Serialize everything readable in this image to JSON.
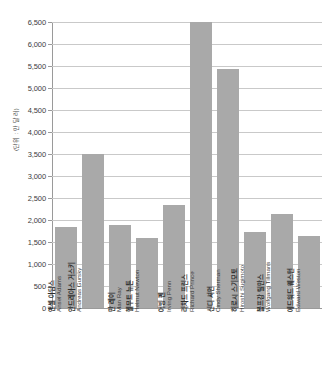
{
  "chart_data": {
    "type": "bar",
    "title": "",
    "subtitle": "",
    "xlabel": "",
    "ylabel": "(단위 : 만 달러)",
    "ylim": [
      0,
      6500
    ],
    "ytick_step": 500,
    "grid": true,
    "legend": null,
    "bar_color": "#a9a9a9",
    "gridline_color": "#c9c9c9",
    "axis_color": "#9a9a9a",
    "ytick_labels": [
      "0",
      "500",
      "1,000",
      "1,500",
      "2,000",
      "2,500",
      "3,000",
      "3,500",
      "4,000",
      "4,500",
      "5,000",
      "5,500",
      "6,000",
      "6,500"
    ],
    "ytick_values": [
      0,
      500,
      1000,
      1500,
      2000,
      2500,
      3000,
      3500,
      4000,
      4500,
      5000,
      5500,
      6000,
      6500
    ],
    "categories": [
      "앤셀 아담스",
      "안드레아스 거스키",
      "만 레이",
      "헬무트 뉴튼",
      "어빙 펜",
      "리차드 프린스",
      "신디 셔먼",
      "히로시 스기모토",
      "볼프강 틸만스",
      "에드워드 웨스턴"
    ],
    "categories_en": [
      "Ansel Adams",
      "Andreas Gursky",
      "Man Ray",
      "Helmut Newton",
      "Irving Penn",
      "Richard Prince",
      "Cindy Sherman",
      "Hiroshi Sugimoto",
      "Wolfgang Tillmans",
      "Edward Weston"
    ],
    "values": [
      1850,
      3500,
      1890,
      1580,
      2340,
      6500,
      5430,
      1730,
      2130,
      1640
    ]
  }
}
